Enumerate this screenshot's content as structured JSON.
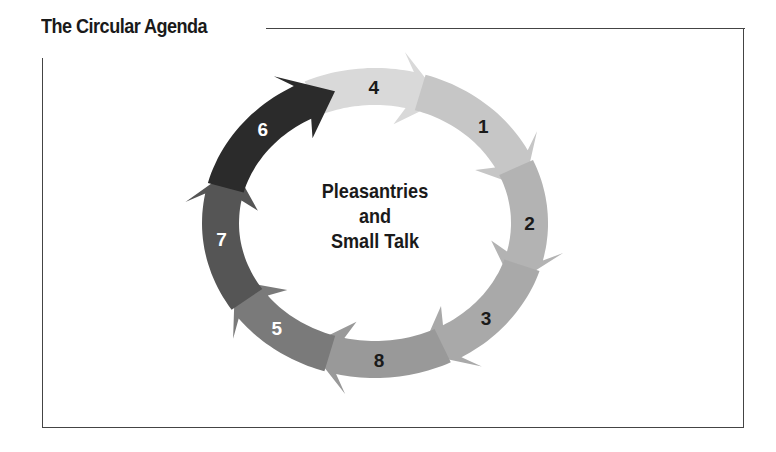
{
  "title": "The Circular Agenda",
  "center_label": {
    "line1": "Pleasantries",
    "line2": "and",
    "line3": "Small Talk"
  },
  "ring": {
    "cx": 375,
    "cy": 223,
    "rx_outer": 173,
    "ry_outer": 155,
    "band": 37
  },
  "segments": [
    {
      "label": "4",
      "start_deg": -108,
      "end_deg": -67,
      "fill": "#d9d9d9",
      "text_color": "#1a1a1a"
    },
    {
      "label": "1",
      "start_deg": -67,
      "end_deg": -18,
      "fill": "#c6c6c6",
      "text_color": "#1a1a1a"
    },
    {
      "label": "2",
      "start_deg": -18,
      "end_deg": 24,
      "fill": "#b3b3b3",
      "text_color": "#1a1a1a"
    },
    {
      "label": "3",
      "start_deg": 24,
      "end_deg": 70,
      "fill": "#a9a9a9",
      "text_color": "#1a1a1a"
    },
    {
      "label": "8",
      "start_deg": 70,
      "end_deg": 113,
      "fill": "#999999",
      "text_color": "#1a1a1a"
    },
    {
      "label": "5",
      "start_deg": 113,
      "end_deg": 152,
      "fill": "#7a7a7a",
      "text_color": "#ffffff"
    },
    {
      "label": "7",
      "start_deg": 152,
      "end_deg": 201,
      "fill": "#555555",
      "text_color": "#ffffff"
    },
    {
      "label": "6",
      "start_deg": 201,
      "end_deg": 252,
      "fill": "#2b2b2b",
      "text_color": "#ffffff"
    }
  ]
}
